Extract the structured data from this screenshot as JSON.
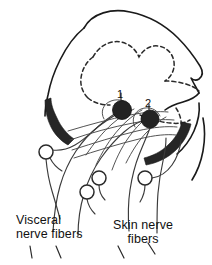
{
  "figure": {
    "background_color": "#ffffff",
    "ink_color": "#1a1a1a",
    "band_color": "#262626"
  },
  "labels": {
    "visceral": {
      "line_1": "Visceral",
      "line_2": "nerve fibers"
    },
    "skin": {
      "line_1": "Skin nerve",
      "line_2": "fibers"
    }
  },
  "nodes": [
    {
      "id": "1",
      "number": "1",
      "name": "neuron-one",
      "cx": 122,
      "cy": 110,
      "r": 9.5
    },
    {
      "id": "2",
      "number": "2",
      "name": "neuron-two",
      "cx": 150,
      "cy": 119,
      "r": 9.0
    }
  ],
  "ganglion_cells": [
    {
      "name": "ganglion-cell-left",
      "cx": 46,
      "cy": 152,
      "r": 7.0
    },
    {
      "name": "ganglion-cell-lower-left",
      "cx": 87,
      "cy": 192,
      "r": 7.0
    },
    {
      "name": "ganglion-cell-center",
      "cx": 99,
      "cy": 178,
      "r": 7.0
    },
    {
      "name": "ganglion-cell-right",
      "cx": 145,
      "cy": 178,
      "r": 7.0
    }
  ],
  "anatomy": {
    "cord_outline": "white-matter-boundary",
    "gray_matter": "butterfly-dashed-boundary",
    "left_band": "left-dark-funiculus-band",
    "right_band": "right-dark-funiculus-band"
  }
}
